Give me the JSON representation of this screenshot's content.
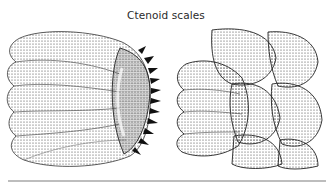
{
  "figure": {
    "title": "Ctenoid scales",
    "illustrations": [
      {
        "id": "single-scale",
        "description": "single ctenoid scale with radiating ridges and spiny posterior margin (ctenii)"
      },
      {
        "id": "overlapping-scales",
        "description": "overlapping ctenoid scales in imbricate arrangement"
      }
    ]
  },
  "colors": {
    "background": "#ffffff",
    "ink": "#222222",
    "rule": "#bdbdbd"
  }
}
